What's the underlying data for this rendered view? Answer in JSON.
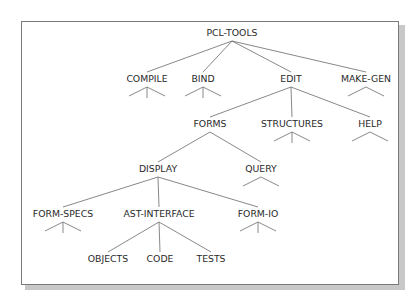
{
  "diagram": {
    "type": "tree",
    "root": "PCL-TOOLS",
    "nodes": [
      {
        "id": "pcl-tools",
        "label": "PCL-TOOLS",
        "x": 232,
        "y": 36
      },
      {
        "id": "compile",
        "label": "COMPILE",
        "x": 147,
        "y": 82,
        "stub": "tri3"
      },
      {
        "id": "bind",
        "label": "BIND",
        "x": 203,
        "y": 82,
        "stub": "tri3"
      },
      {
        "id": "edit",
        "label": "EDIT",
        "x": 291,
        "y": 82
      },
      {
        "id": "make-gen",
        "label": "MAKE-GEN",
        "x": 366,
        "y": 82,
        "stub": "tri2"
      },
      {
        "id": "forms",
        "label": "FORMS",
        "x": 210,
        "y": 127
      },
      {
        "id": "structures",
        "label": "STRUCTURES",
        "x": 292,
        "y": 127,
        "stub": "tri3"
      },
      {
        "id": "help",
        "label": "HELP",
        "x": 370,
        "y": 127,
        "stub": "tri2"
      },
      {
        "id": "display",
        "label": "DISPLAY",
        "x": 158,
        "y": 172
      },
      {
        "id": "query",
        "label": "QUERY",
        "x": 261,
        "y": 172,
        "stub": "tri2"
      },
      {
        "id": "form-specs",
        "label": "FORM-SPECS",
        "x": 63,
        "y": 217,
        "stub": "tri3"
      },
      {
        "id": "ast-interface",
        "label": "AST-INTERFACE",
        "x": 159,
        "y": 217
      },
      {
        "id": "form-io",
        "label": "FORM-IO",
        "x": 258,
        "y": 217,
        "stub": "tri3"
      },
      {
        "id": "objects",
        "label": "OBJECTS",
        "x": 108,
        "y": 262
      },
      {
        "id": "code",
        "label": "CODE",
        "x": 160,
        "y": 262
      },
      {
        "id": "tests",
        "label": "TESTS",
        "x": 211,
        "y": 262
      }
    ],
    "edges": [
      [
        "pcl-tools",
        "compile"
      ],
      [
        "pcl-tools",
        "bind"
      ],
      [
        "pcl-tools",
        "edit"
      ],
      [
        "pcl-tools",
        "make-gen"
      ],
      [
        "edit",
        "forms"
      ],
      [
        "edit",
        "structures"
      ],
      [
        "edit",
        "help"
      ],
      [
        "forms",
        "display"
      ],
      [
        "forms",
        "query"
      ],
      [
        "display",
        "form-specs"
      ],
      [
        "display",
        "ast-interface"
      ],
      [
        "display",
        "form-io"
      ],
      [
        "ast-interface",
        "objects"
      ],
      [
        "ast-interface",
        "code"
      ],
      [
        "ast-interface",
        "tests"
      ]
    ]
  },
  "colors": {
    "text": "#2a2a2a",
    "line": "#6a6a6a",
    "frame": "#7a7a7a",
    "shadow": "#c8c8c8"
  }
}
